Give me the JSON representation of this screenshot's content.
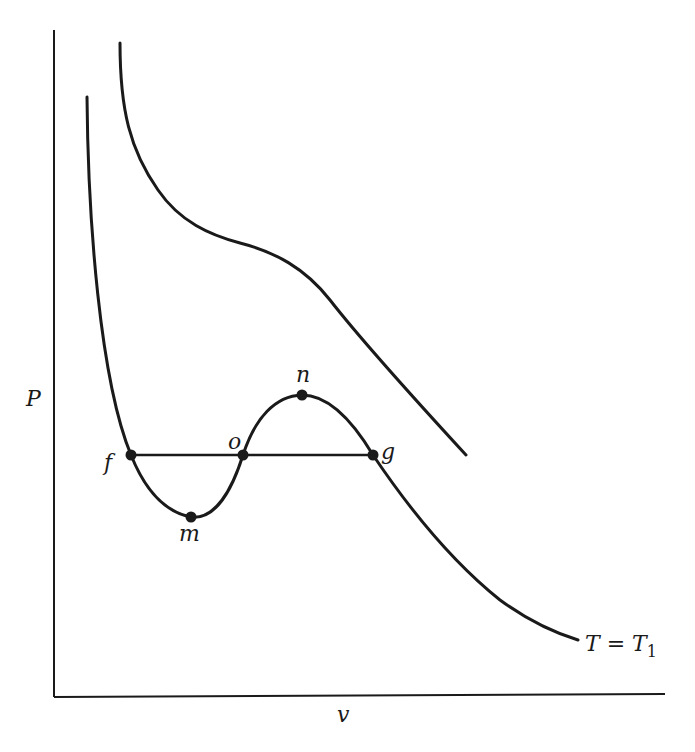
{
  "diagram": {
    "type": "P-v isotherm diagram (van der Waals loop)",
    "axes": {
      "y_label": "P",
      "x_label": "v"
    },
    "curves": [
      {
        "id": "upper-isotherm",
        "label": "",
        "description": "higher-temperature isotherm, monotonically decreasing with an inflection"
      },
      {
        "id": "lower-isotherm",
        "label": "T = T1",
        "label_main": "T = T",
        "label_sub": "1",
        "description": "isotherm with van der Waals loop through f, m, o, n, g"
      }
    ],
    "tie_line": {
      "from": "f",
      "to": "g",
      "through": "o",
      "description": "horizontal equal-pressure line"
    },
    "points": [
      {
        "name": "f",
        "label": "f",
        "role": "left intersection with tie line"
      },
      {
        "name": "m",
        "label": "m",
        "role": "local minimum"
      },
      {
        "name": "o",
        "label": "o",
        "role": "middle intersection with tie line"
      },
      {
        "name": "n",
        "label": "n",
        "role": "local maximum"
      },
      {
        "name": "g",
        "label": "g",
        "role": "right intersection with tie line"
      }
    ],
    "colors": {
      "ink": "#1a1a1a",
      "background": "#ffffff"
    }
  }
}
